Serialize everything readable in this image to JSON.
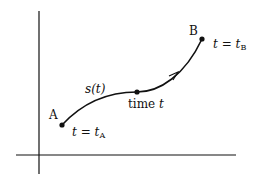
{
  "diagram": {
    "points": {
      "start": {
        "label": "A",
        "time_var": "t",
        "equals": "=",
        "time_base": "t",
        "time_sub": "A"
      },
      "middle": {
        "label_prefix": "time",
        "label_var": "t"
      },
      "end": {
        "label": "B",
        "time_var": "t",
        "equals": "=",
        "time_base": "t",
        "time_sub": "B"
      }
    },
    "curve": {
      "label": "s(t)",
      "direction": "A-to-B"
    },
    "colors": {
      "ink": "#111111",
      "background": "#ffffff"
    }
  }
}
